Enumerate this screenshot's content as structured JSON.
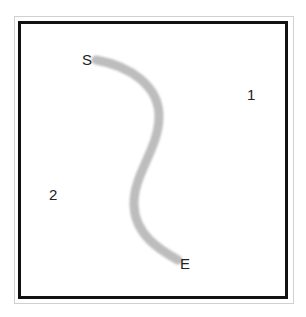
{
  "diagram": {
    "labels": {
      "start": "S",
      "end": "E",
      "region_1": "1",
      "region_2": "2"
    },
    "path": {
      "color": "#bdbdbd",
      "stroke_width": 9
    },
    "colors": {
      "frame": "#111111",
      "outer_frame": "#d0d0d0",
      "background": "#ffffff"
    }
  }
}
